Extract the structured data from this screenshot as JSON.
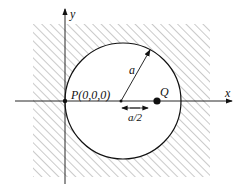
{
  "diagram": {
    "axis_x_label": "x",
    "axis_y_label": "y",
    "point_p_label": "P(0,0,0)",
    "point_q_label": "Q",
    "radius_label": "a",
    "offset_label": "a/2",
    "colors": {
      "line": "#111111",
      "hatch": "#888888",
      "background": "#ffffff"
    }
  }
}
